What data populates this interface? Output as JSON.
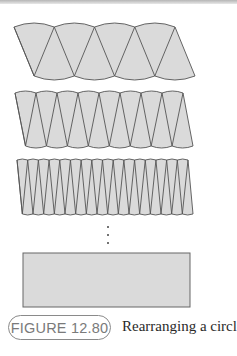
{
  "figure": {
    "label": "FIGURE 12.80",
    "caption": "Rearranging a circle"
  },
  "diagram": {
    "rows": [
      {
        "sectors_up": 4,
        "sectors_down": 4
      },
      {
        "sectors_up": 8,
        "sectors_down": 8
      },
      {
        "sectors_up": 16,
        "sectors_down": 16
      }
    ],
    "ellipsis": "⋮",
    "limit_shape": "rectangle"
  },
  "colors": {
    "fill": "#dadada",
    "stroke": "#555555",
    "pill_border": "#8a8a8a",
    "pill_text": "#7a7a7a"
  }
}
